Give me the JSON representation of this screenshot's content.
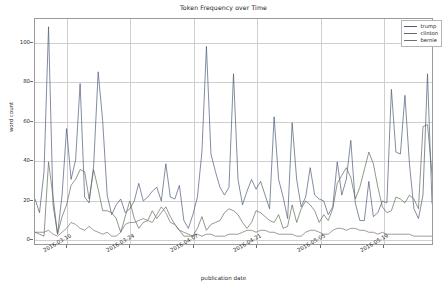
{
  "chart_data": {
    "type": "line",
    "title": "Token Frequency over Time",
    "xlabel": "publication date",
    "ylabel": "word count",
    "grid": true,
    "legend_position": "upper right",
    "ylim": [
      -3,
      112
    ],
    "yticks": [
      0,
      20,
      40,
      60,
      80,
      100
    ],
    "xtick_labels": [
      "2016-03-10",
      "2016-03-24",
      "2016-04-07",
      "2016-04-21",
      "2016-05-05",
      "2016-05-19"
    ],
    "xtick_index": [
      7,
      21,
      35,
      49,
      63,
      77
    ],
    "x_index_range": [
      0,
      88
    ],
    "colors": {
      "trump": "#4a5a78",
      "clinton": "#5d6b58",
      "bernie": "#7a6b6b"
    },
    "series": [
      {
        "name": "trump",
        "color": "#4a5a78",
        "values": [
          20,
          13,
          34,
          108,
          17,
          2,
          22,
          56,
          30,
          40,
          79,
          21,
          18,
          37,
          85,
          60,
          22,
          12,
          17,
          20,
          13,
          15,
          19,
          28,
          19,
          21,
          24,
          26,
          19,
          38,
          21,
          20,
          27,
          9,
          5,
          12,
          21,
          44,
          98,
          43,
          34,
          26,
          22,
          26,
          84,
          30,
          17,
          24,
          30,
          25,
          29,
          22,
          15,
          62,
          30,
          21,
          10,
          59,
          30,
          16,
          21,
          36,
          22,
          20,
          19,
          12,
          16,
          39,
          22,
          30,
          50,
          18,
          9,
          9,
          29,
          11,
          13,
          19,
          18,
          76,
          44,
          43,
          73,
          38,
          15,
          10,
          22,
          84,
          18,
          10,
          12
        ]
      },
      {
        "name": "clinton",
        "color": "#5d6b58",
        "values": [
          3,
          2,
          1,
          39,
          21,
          2,
          11,
          17,
          27,
          30,
          35,
          34,
          20,
          35,
          25,
          14,
          14,
          13,
          10,
          3,
          11,
          19,
          10,
          5,
          8,
          9,
          14,
          10,
          13,
          16,
          11,
          7,
          4,
          1,
          1,
          1,
          5,
          11,
          4,
          7,
          8,
          9,
          13,
          15,
          14,
          12,
          8,
          5,
          8,
          14,
          13,
          11,
          9,
          8,
          12,
          5,
          6,
          17,
          8,
          15,
          19,
          17,
          14,
          8,
          12,
          9,
          15,
          28,
          32,
          36,
          31,
          20,
          26,
          35,
          44,
          38,
          26,
          16,
          13,
          14,
          21,
          20,
          18,
          22,
          20,
          15,
          57,
          58,
          33,
          12,
          11
        ]
      },
      {
        "name": "bernie",
        "color": "#7a6b6b",
        "values": [
          3,
          3,
          3,
          4,
          2,
          1,
          3,
          5,
          8,
          7,
          5,
          4,
          6,
          4,
          3,
          2,
          3,
          1,
          1,
          3,
          7,
          8,
          8,
          9,
          10,
          9,
          8,
          12,
          16,
          13,
          8,
          7,
          4,
          3,
          2,
          1,
          2,
          1,
          2,
          2,
          1,
          1,
          1,
          2,
          2,
          2,
          3,
          4,
          4,
          3,
          4,
          4,
          3,
          3,
          2,
          2,
          2,
          2,
          1,
          1,
          3,
          4,
          4,
          3,
          2,
          2,
          4,
          5,
          5,
          4,
          5,
          5,
          4,
          4,
          3,
          3,
          2,
          3,
          2,
          2,
          2,
          2,
          2,
          2,
          1,
          1,
          1,
          1,
          1,
          1,
          1
        ]
      }
    ]
  },
  "legend": {
    "items": [
      {
        "label": "trump"
      },
      {
        "label": "clinton"
      },
      {
        "label": "bernie"
      }
    ]
  }
}
